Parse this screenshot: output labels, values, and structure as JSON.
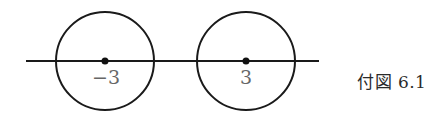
{
  "figure": {
    "caption": "付図 6.1",
    "stroke_color": "#1a1a1a",
    "label_color": "#666666",
    "axis_line": {
      "x1": 26,
      "x2": 319,
      "y": 61
    },
    "circles": [
      {
        "cx": 105,
        "cy": 61,
        "r": 49,
        "label": "−3",
        "label_x": 106,
        "label_y": 84
      },
      {
        "cx": 246,
        "cy": 61,
        "r": 49,
        "label": "3",
        "label_x": 246,
        "label_y": 84
      }
    ]
  }
}
